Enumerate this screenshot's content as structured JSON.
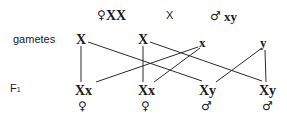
{
  "header": {
    "female_symbol": "♀",
    "female_genotype": "XX",
    "cross": "X",
    "male_symbol": "♂",
    "male_genotype": "xy"
  },
  "labels": {
    "gametes": "gametes",
    "f1": "F",
    "f1_sub": "1"
  },
  "gametes": [
    "X",
    "X",
    "x",
    "y"
  ],
  "offspring": [
    {
      "genotype": "Xx",
      "sex": "♀"
    },
    {
      "genotype": "Xx",
      "sex": "♀"
    },
    {
      "genotype": "Xy",
      "sex": "♂"
    },
    {
      "genotype": "Xy",
      "sex": "♂"
    }
  ],
  "colors": {
    "ink": "#1a1a1a",
    "background": "#ffffff"
  }
}
